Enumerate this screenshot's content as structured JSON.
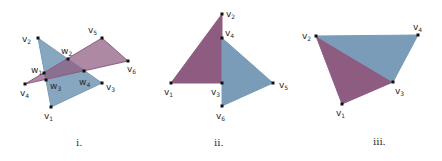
{
  "colors": {
    "purple": "#8e5c80",
    "blue": "#7a9cb8",
    "edge": "#5a4a60",
    "point": "#111111"
  },
  "figures": [
    {
      "caption": "i.",
      "caption_pos": [
        76,
        146
      ],
      "polygons": [
        {
          "color": "blue",
          "opacity": 0.9,
          "points": "38,38 102,83 51,107"
        },
        {
          "color": "purple",
          "opacity": 0.72,
          "points": "25,84 102,38 128,61"
        }
      ],
      "vertices": [
        {
          "name": "v",
          "sub": "2",
          "x": 38,
          "y": 38,
          "lx": 22,
          "ly": 42
        },
        {
          "name": "v",
          "sub": "5",
          "x": 102,
          "y": 38,
          "lx": 88,
          "ly": 33
        },
        {
          "name": "w",
          "sub": "2",
          "x": 68,
          "y": 59,
          "lx": 61,
          "ly": 54
        },
        {
          "name": "v",
          "sub": "6",
          "x": 128,
          "y": 61,
          "lx": 127,
          "ly": 72
        },
        {
          "name": "w",
          "sub": "1",
          "x": 44,
          "y": 73,
          "lx": 31,
          "ly": 73
        },
        {
          "name": "w",
          "sub": "4",
          "x": 84,
          "y": 71,
          "lx": 79,
          "ly": 85
        },
        {
          "name": "v",
          "sub": "4",
          "x": 25,
          "y": 84,
          "lx": 20,
          "ly": 96
        },
        {
          "name": "w",
          "sub": "3",
          "x": 46,
          "y": 80,
          "lx": 50,
          "ly": 89
        },
        {
          "name": "v",
          "sub": "3",
          "x": 102,
          "y": 83,
          "lx": 106,
          "ly": 90
        },
        {
          "name": "v",
          "sub": "1",
          "x": 51,
          "y": 107,
          "lx": 44,
          "ly": 119
        }
      ]
    },
    {
      "caption": "ii.",
      "caption_pos": [
        214,
        146
      ],
      "polygons": [
        {
          "color": "purple",
          "opacity": 1,
          "points": "171,83 222,14 222,83"
        },
        {
          "color": "blue",
          "opacity": 1,
          "points": "222,38 273,83 222,106"
        }
      ],
      "vertices": [
        {
          "name": "v",
          "sub": "2",
          "x": 222,
          "y": 14,
          "lx": 226,
          "ly": 17
        },
        {
          "name": "v",
          "sub": "4",
          "x": 222,
          "y": 38,
          "lx": 225,
          "ly": 36
        },
        {
          "name": "v",
          "sub": "1",
          "x": 171,
          "y": 83,
          "lx": 164,
          "ly": 95
        },
        {
          "name": "v",
          "sub": "3",
          "x": 222,
          "y": 83,
          "lx": 211,
          "ly": 95
        },
        {
          "name": "v",
          "sub": "5",
          "x": 273,
          "y": 83,
          "lx": 279,
          "ly": 88
        },
        {
          "name": "v",
          "sub": "6",
          "x": 222,
          "y": 106,
          "lx": 216,
          "ly": 119
        }
      ]
    },
    {
      "caption": "iii.",
      "caption_pos": [
        373,
        145
      ],
      "polygons": [
        {
          "color": "purple",
          "opacity": 1,
          "points": "316,36 393,82 342,104"
        },
        {
          "color": "blue",
          "opacity": 1,
          "points": "316,36 418,35 393,82"
        }
      ],
      "vertices": [
        {
          "name": "v",
          "sub": "2",
          "x": 316,
          "y": 36,
          "lx": 302,
          "ly": 39
        },
        {
          "name": "v",
          "sub": "4",
          "x": 418,
          "y": 35,
          "lx": 413,
          "ly": 30
        },
        {
          "name": "v",
          "sub": "3",
          "x": 393,
          "y": 82,
          "lx": 395,
          "ly": 94
        },
        {
          "name": "v",
          "sub": "1",
          "x": 342,
          "y": 104,
          "lx": 336,
          "ly": 116
        }
      ]
    }
  ]
}
